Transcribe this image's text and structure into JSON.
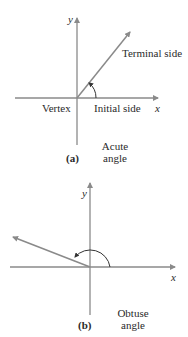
{
  "colors": {
    "axis": "#8a8a8a",
    "ray": "#8a8a8a",
    "arc": "#333333",
    "text": "#2a2a2a"
  },
  "panel_a": {
    "x_axis_label": "x",
    "y_axis_label": "y",
    "terminal_label": "Terminal side",
    "vertex_label": "Vertex",
    "initial_label": "Initial side",
    "tag": "(a)",
    "caption_line1": "Acute",
    "caption_line2": "angle"
  },
  "panel_b": {
    "x_axis_label": "x",
    "y_axis_label": "y",
    "tag": "(b)",
    "caption_line1": "Obtuse",
    "caption_line2": "angle"
  }
}
